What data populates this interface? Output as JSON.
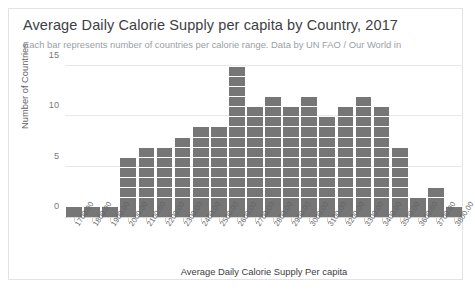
{
  "card": {
    "title": "Average Daily Calorie Supply per capita by Country, 2017",
    "subtitle": "Each bar represents number of countries per calorie range. Data by UN FAO / Our World in"
  },
  "chart_data": {
    "type": "bar",
    "title": "Average Daily Calorie Supply per capita by Country, 2017",
    "subtitle": "Each bar represents number of countries per calorie range. Data by UN FAO / Our World in",
    "xlabel": "Average Daily Calorie Supply Per capita",
    "ylabel": "Number of Countries",
    "categories": [
      "1700.00",
      "1800.00",
      "1900.00",
      "2000.00",
      "2100.00",
      "2200.00",
      "2300.00",
      "2400.00",
      "2500.00",
      "2600.00",
      "2700.00",
      "2800.00",
      "2900.00",
      "3000.00",
      "3100.00",
      "3200.00",
      "3300.00",
      "3400.00",
      "3500.00",
      "3600.00",
      "3700.00",
      "3800.00"
    ],
    "values": [
      1,
      1,
      1,
      6,
      7,
      7,
      8,
      9,
      9,
      15,
      11,
      12,
      11,
      12,
      10,
      11,
      12,
      11,
      7,
      2,
      3,
      1
    ],
    "ylim": [
      0,
      15
    ],
    "yticks": [
      "0",
      "5",
      "10",
      "15"
    ],
    "ytick_values": [
      0,
      5,
      10,
      15
    ],
    "grid": true,
    "legend": false,
    "bar_color": "#767676",
    "grid_color": "#e8e8e8"
  }
}
